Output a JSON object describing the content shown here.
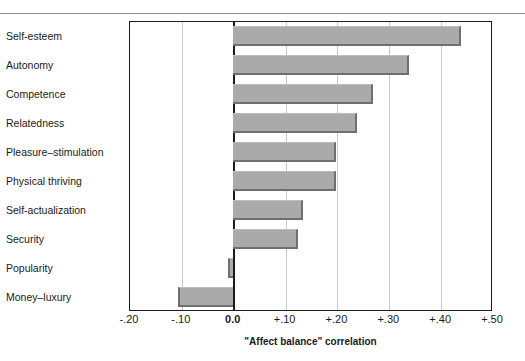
{
  "chart_data": {
    "type": "bar",
    "orientation": "horizontal",
    "title": "",
    "xlabel": "\"Affect balance\" correlation",
    "ylabel": "",
    "xlim": [
      -0.2,
      0.5
    ],
    "xticks": [
      -0.2,
      -0.1,
      0.0,
      0.1,
      0.2,
      0.3,
      0.4,
      0.5
    ],
    "xticklabels": [
      "-.20",
      "-.10",
      "0.0",
      "+.10",
      "+.20",
      "+.30",
      "+.40",
      "+.50"
    ],
    "grid": "vertical-dotted-at-ticks",
    "legend": "none",
    "categories": [
      "Self-esteem",
      "Autonomy",
      "Competence",
      "Relatedness",
      "Pleasure–stimulation",
      "Physical thriving",
      "Self-actualization",
      "Security",
      "Popularity",
      "Money–luxury"
    ],
    "values": [
      0.44,
      0.34,
      0.27,
      0.24,
      0.2,
      0.2,
      0.135,
      0.125,
      -0.01,
      -0.105
    ],
    "bar_fill_color": "#aaaaaa",
    "bar_edge_color": "#6f6f6f",
    "frame_color": "#1c1c1c",
    "gridline_color": "#c9c9c9"
  }
}
